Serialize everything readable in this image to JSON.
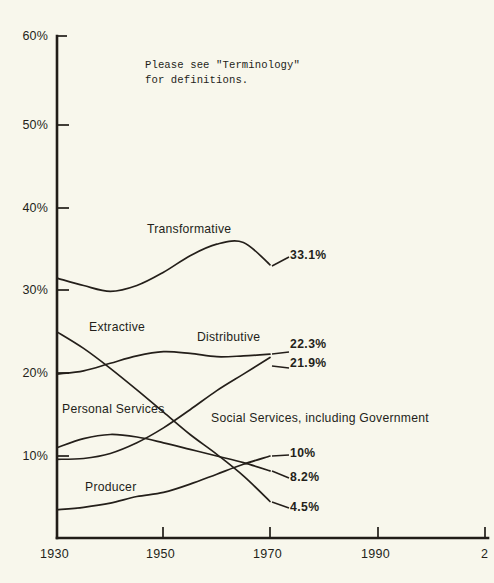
{
  "note": {
    "line1": "Please see \"Terminology\"",
    "line2": "for definitions."
  },
  "chart_data": {
    "type": "line",
    "title": "",
    "subtitle": "",
    "xlabel": "",
    "ylabel": "",
    "xlim": [
      1930,
      2010
    ],
    "ylim": [
      0,
      60
    ],
    "grid": false,
    "legend_position": "inline-labels",
    "x_ticks": [
      "1930",
      "1950",
      "1970",
      "1990",
      "2010"
    ],
    "x_tick_values": [
      1930,
      1950,
      1970,
      1990,
      2010
    ],
    "x_last_tick_clipped": "2",
    "y_ticks": [
      "10%",
      "20%",
      "30%",
      "40%",
      "50%",
      "60%"
    ],
    "y_tick_values": [
      10,
      20,
      30,
      40,
      50,
      60
    ],
    "annotations": [
      "Please see \"Terminology\" for definitions."
    ],
    "series": [
      {
        "name": "Transformative",
        "label": "Transformative",
        "end_label": "33.1%",
        "end_value": 33.1,
        "x": [
          1930,
          1935,
          1940,
          1945,
          1950,
          1955,
          1960,
          1965,
          1970
        ],
        "values": [
          31.5,
          30.6,
          29.9,
          30.6,
          32.2,
          34.2,
          35.6,
          35.8,
          33.1
        ]
      },
      {
        "name": "Extractive",
        "label": "Extractive",
        "end_label": "4.5%",
        "end_value": 4.5,
        "x": [
          1930,
          1935,
          1940,
          1945,
          1950,
          1955,
          1960,
          1965,
          1970
        ],
        "values": [
          25.0,
          23.0,
          20.6,
          18.0,
          15.3,
          12.6,
          10.2,
          7.6,
          4.5
        ]
      },
      {
        "name": "Distributive",
        "label": "Distributive",
        "end_label": "22.3%",
        "end_value": 22.3,
        "x": [
          1930,
          1935,
          1940,
          1945,
          1950,
          1955,
          1960,
          1965,
          1970
        ],
        "values": [
          19.9,
          20.3,
          21.2,
          22.1,
          22.6,
          22.4,
          22.0,
          22.1,
          22.3
        ]
      },
      {
        "name": "Personal Services",
        "label": "Personal Services",
        "end_label": "8.2%",
        "end_value": 8.2,
        "x": [
          1930,
          1935,
          1940,
          1945,
          1950,
          1955,
          1960,
          1965,
          1970
        ],
        "values": [
          11.0,
          12.1,
          12.6,
          12.3,
          11.6,
          10.8,
          10.0,
          9.2,
          8.2
        ]
      },
      {
        "name": "Social Services, including Government",
        "label": "Social Services, including Government",
        "end_label": "21.9%",
        "end_value": 21.9,
        "x": [
          1930,
          1935,
          1940,
          1945,
          1950,
          1955,
          1960,
          1965,
          1970
        ],
        "values": [
          9.6,
          9.7,
          10.3,
          11.6,
          13.4,
          15.6,
          17.9,
          19.9,
          21.9
        ]
      },
      {
        "name": "Producer",
        "label": "Producer",
        "end_label": "10%",
        "end_value": 10.0,
        "x": [
          1930,
          1935,
          1940,
          1945,
          1950,
          1955,
          1960,
          1965,
          1970
        ],
        "values": [
          3.5,
          3.8,
          4.3,
          5.1,
          5.6,
          6.6,
          7.8,
          9.0,
          10.0
        ]
      }
    ]
  },
  "labels": {
    "transformative": "Transformative",
    "extractive": "Extractive",
    "distributive": "Distributive",
    "personal_services": "Personal Services",
    "social_services": "Social Services, including Government",
    "producer": "Producer"
  },
  "values": {
    "transformative": "33.1%",
    "distributive": "22.3%",
    "social_services": "21.9%",
    "producer": "10%",
    "personal_services": "8.2%",
    "extractive": "4.5%"
  },
  "axis": {
    "y": {
      "t60": "60%",
      "t50": "50%",
      "t40": "40%",
      "t30": "30%",
      "t20": "20%",
      "t10": "10%"
    },
    "x": {
      "t1930": "1930",
      "t1950": "1950",
      "t1970": "1970",
      "t1990": "1990",
      "t2010": "2"
    }
  },
  "colors": {
    "background": "#f8f7ec",
    "ink": "#241f1a"
  }
}
